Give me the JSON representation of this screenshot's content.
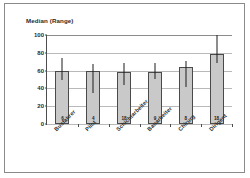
{
  "chart_data": {
    "type": "bar",
    "title": "Median (Range)",
    "xlabel": "",
    "ylabel": "Median (Range)",
    "ylim": [
      0,
      100
    ],
    "yticks": [
      0,
      20,
      40,
      60,
      80,
      100
    ],
    "grid": true,
    "legend": "none",
    "categories": [
      "Busfahrer",
      "Pilot",
      "Schichtarbeiter",
      "Bauarbeiter",
      "Chirurg",
      "Dirigent"
    ],
    "values": [
      60,
      60,
      59,
      59,
      64,
      79
    ],
    "sample_sizes": [
      6,
      4,
      18,
      9,
      8,
      18
    ],
    "error_low": [
      49,
      35,
      44,
      50,
      41,
      68
    ],
    "error_high": [
      74,
      67,
      68,
      68,
      71,
      100
    ],
    "series": [
      {
        "name": "Median",
        "values": [
          60,
          60,
          59,
          59,
          64,
          79
        ]
      },
      {
        "name": "Range",
        "low": [
          49,
          35,
          44,
          50,
          41,
          68
        ],
        "high": [
          74,
          67,
          68,
          68,
          71,
          100
        ]
      }
    ],
    "bar_color": "#c9c9c9",
    "bar_border_color": "#4a4a4a",
    "error_color": "#1c1c1c",
    "axis_color": "#4d4d4d",
    "grid_color": "#b9b9b9"
  }
}
